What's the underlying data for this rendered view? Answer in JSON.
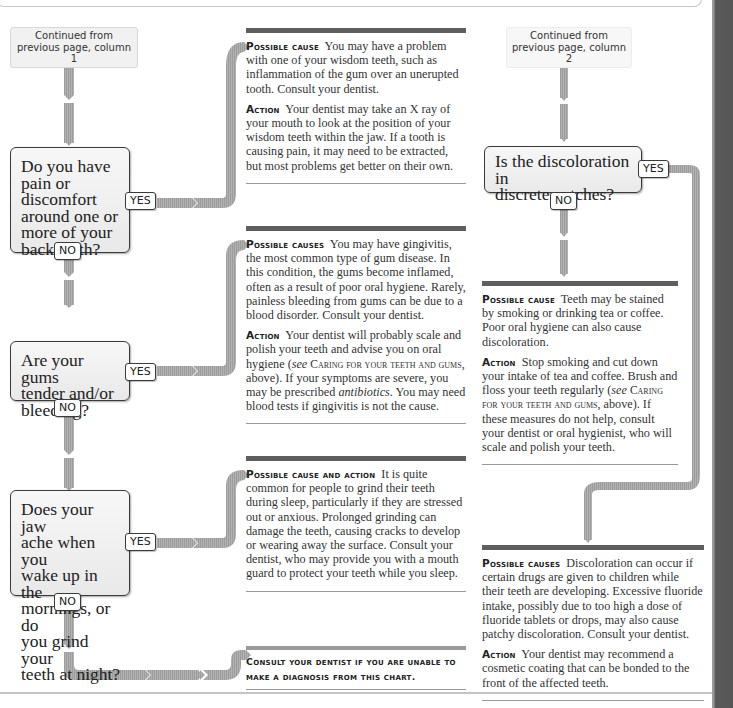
{
  "colors": {
    "connector": "#acacac",
    "panel_topbar": "#5e5e5e",
    "side_bar": "#565656",
    "question_border": "#3a3a3a"
  },
  "left_column": {
    "continued": {
      "line1": "Continued from",
      "line2": "previous page, column 1"
    },
    "questions": [
      {
        "lines": [
          "Do you have",
          "pain or",
          "discomfort",
          "around one or",
          "more of your",
          "back teeth?"
        ],
        "yes_label": "YES",
        "no_label": "NO"
      },
      {
        "lines": [
          "Are your gums",
          "tender and/or",
          "bleeding?"
        ],
        "yes_label": "YES",
        "no_label": "NO"
      },
      {
        "lines": [
          "Does your jaw",
          "ache when you",
          "wake up in the",
          "mornings, or do",
          "you grind your",
          "teeth at night?"
        ],
        "yes_label": "YES",
        "no_label": "NO"
      }
    ]
  },
  "middle_column": {
    "panels": [
      {
        "paragraphs": [
          {
            "label": "Possible cause",
            "text": "You may have a problem with one of your wisdom teeth, such as inflammation of the gum over an unerupted tooth. Consult your dentist."
          },
          {
            "label": "Action",
            "text": "Your dentist may take an X ray of your mouth to look at the position of your wisdom teeth within the jaw. If a tooth is causing pain, it may need to be extracted, but most problems get better on their own."
          }
        ]
      },
      {
        "paragraphs": [
          {
            "label": "Possible causes",
            "text": "You may have gingivitis, the most common type of gum disease. In this condition, the gums become inflamed, often as a result of poor oral hygiene. Rarely, painless bleeding from gums can be due to a blood disorder. Consult your dentist."
          },
          {
            "label": "Action",
            "text_a": "Your dentist will probably scale and polish your teeth and advise you on oral hygiene (",
            "see": "see",
            "ref": "Caring for your teeth and gums",
            "text_b": ", above). If your symptoms are severe, you may be prescribed ",
            "italic": "antibiotics",
            "text_c": ". You may need blood tests if gingivitis is not the cause."
          }
        ]
      },
      {
        "paragraphs": [
          {
            "label": "Possible cause and action",
            "text": "It is quite common for people to grind their teeth during sleep, particularly if they are stressed out or anxious. Prolonged grinding can damage the teeth, causing cracks to develop or wearing away the surface. Consult your dentist, who may provide you with a mouth guard to protect your teeth while you sleep."
          }
        ]
      }
    ],
    "consult_note": {
      "line1": "Consult your dentist if you are unable to",
      "line2": "make a diagnosis from this chart."
    }
  },
  "right_column": {
    "continued": {
      "line1": "Continued from",
      "line2": "previous page, column 2"
    },
    "question": {
      "lines": [
        "Is the discoloration in",
        "discrete patches?"
      ],
      "yes_label": "YES",
      "no_label": "NO"
    },
    "panels": [
      {
        "paragraphs": [
          {
            "label": "Possible cause",
            "text": "Teeth may be stained by smoking or drinking tea or coffee. Poor oral hygiene can also cause discoloration."
          },
          {
            "label": "Action",
            "text_a": "Stop smoking and cut down your intake of tea and coffee. Brush and floss your teeth regularly (",
            "see": "see",
            "ref": "Caring for your teeth and gums",
            "text_b": ", above). If these measures do not help, consult your dentist or oral hygienist, who will scale and polish your teeth."
          }
        ]
      },
      {
        "paragraphs": [
          {
            "label": "Possible causes",
            "text": "Discoloration can occur if certain drugs are given to children while their teeth are developing. Excessive fluoride intake, possibly due to too high a dose of fluoride tablets or drops, may also cause patchy discoloration. Consult your dentist."
          },
          {
            "label": "Action",
            "text": "Your dentist may recommend a cosmetic coating that can be bonded to the front of the affected teeth."
          }
        ]
      }
    ]
  }
}
